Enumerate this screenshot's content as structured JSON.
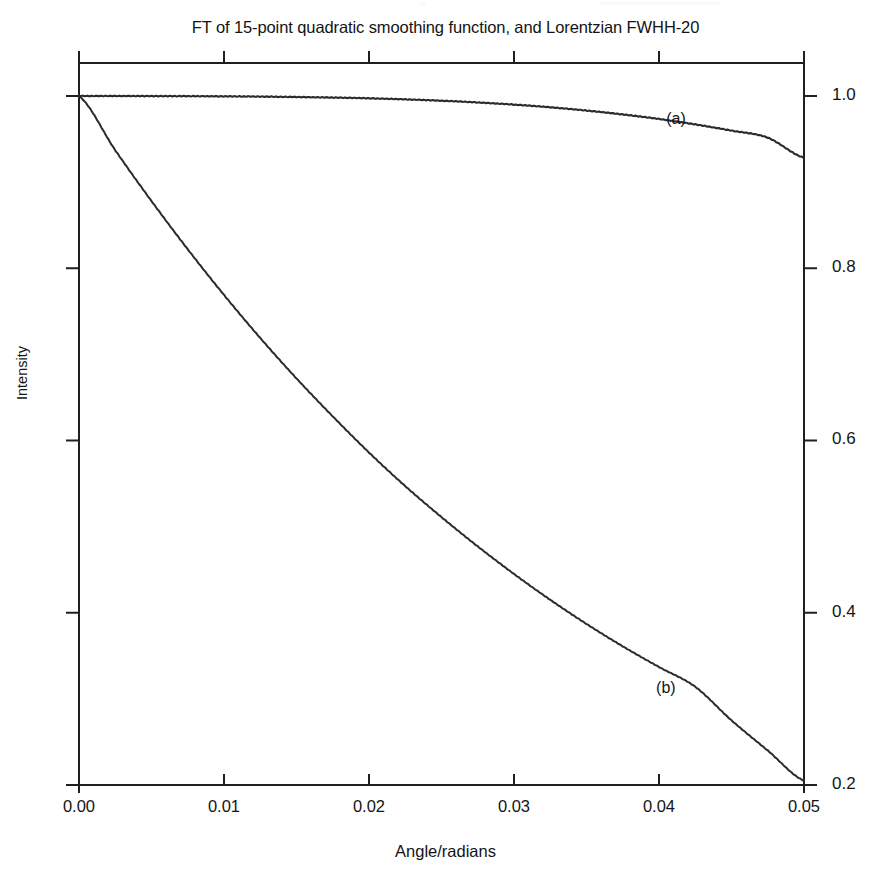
{
  "chart_data": {
    "type": "line",
    "title": "FT of 15-point quadratic smoothing function, and Lorentzian FWHH-20",
    "xlabel": "Angle/radians",
    "ylabel": "Intensity",
    "xlim": [
      0.0,
      0.05
    ],
    "ylim": [
      0.2,
      1.0
    ],
    "grid": false,
    "legend_position": "inline-annotations",
    "xticks": [
      0.0,
      0.01,
      0.02,
      0.03,
      0.04,
      0.05
    ],
    "xticklabels": [
      "0.00",
      "0.01",
      "0.02",
      "0.03",
      "0.04",
      "0.05"
    ],
    "yticks": [
      1.0,
      0.8,
      0.6,
      0.4,
      0.2
    ],
    "yticklabels": [
      "1.0",
      "0.8",
      "0.6",
      "0.4",
      "0.2"
    ],
    "ytick_side": "right",
    "annotations": [
      {
        "text": "(a)",
        "x": 0.0405,
        "y": 0.972
      },
      {
        "text": "(b)",
        "x": 0.0398,
        "y": 0.311
      }
    ],
    "series": [
      {
        "name": "(a)",
        "description": "FT of 15-point quadratic smoothing function",
        "x": [
          0.0,
          0.0025,
          0.005,
          0.0075,
          0.01,
          0.0125,
          0.015,
          0.0175,
          0.02,
          0.0225,
          0.025,
          0.0275,
          0.03,
          0.0325,
          0.035,
          0.0375,
          0.04,
          0.0425,
          0.045,
          0.0475,
          0.05
        ],
        "values": [
          1.0,
          1.0,
          0.9999,
          0.9998,
          0.9996,
          0.9993,
          0.9988,
          0.9982,
          0.9973,
          0.9961,
          0.9945,
          0.9925,
          0.99,
          0.9869,
          0.9831,
          0.9786,
          0.9733,
          0.967,
          0.9598,
          0.9516,
          0.9283
        ]
      },
      {
        "name": "(b)",
        "description": "Lorentzian FWHH-20",
        "x": [
          0.0,
          0.0025,
          0.005,
          0.0075,
          0.01,
          0.0125,
          0.015,
          0.0175,
          0.02,
          0.0225,
          0.025,
          0.0275,
          0.03,
          0.0325,
          0.035,
          0.0375,
          0.04,
          0.0425,
          0.045,
          0.0475,
          0.05
        ],
        "values": [
          1.0,
          0.937,
          0.878,
          0.822,
          0.769,
          0.719,
          0.672,
          0.628,
          0.586,
          0.547,
          0.511,
          0.477,
          0.445,
          0.415,
          0.387,
          0.361,
          0.337,
          0.314,
          0.275,
          0.24,
          0.205
        ]
      }
    ]
  },
  "axes_geometry": {
    "left_px": 79,
    "right_px": 804,
    "top_px": 63,
    "bottom_px": 785,
    "y_value_at_top_px": 1.0383,
    "y_value_at_bottom_px": 0.2
  },
  "colors": {
    "line": "#2b2b2b",
    "axis": "#1f1f1f",
    "background": "#ffffff",
    "text": "#141414"
  }
}
